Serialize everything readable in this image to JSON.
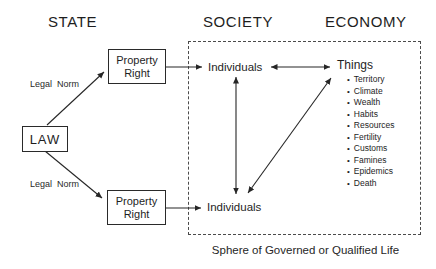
{
  "headers": {
    "state": "STATE",
    "society": "SOCIETY",
    "economy": "ECONOMY"
  },
  "state": {
    "law": "LAW",
    "property_right_top": "Property Right",
    "property_right_bottom": "Property Right",
    "legal_norm_top": "Legal Norm",
    "legal_norm_bottom": "Legal Norm"
  },
  "society": {
    "individuals_top": "Individuals",
    "individuals_bottom": "Individuals"
  },
  "economy": {
    "things": "Things",
    "bullet": "•",
    "items": [
      "Territory",
      "Climate",
      "Wealth",
      "Habits",
      "Resources",
      "Fertility",
      "Customs",
      "Famines",
      "Epidemics",
      "Death"
    ]
  },
  "caption": "Sphere of Governed or Qualified Life",
  "colors": {
    "ink": "#1e1e1e",
    "background": "#ffffff",
    "dashed_border": "#4a4a4a"
  }
}
